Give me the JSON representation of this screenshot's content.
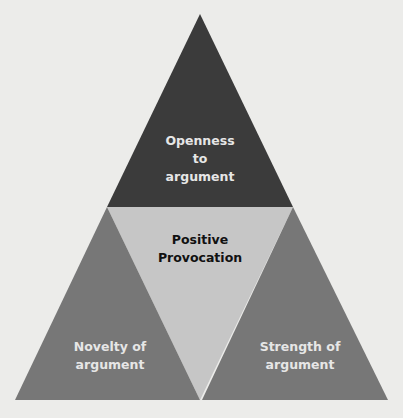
{
  "diagram": {
    "type": "triangle-of-triangles",
    "top": {
      "label_lines": [
        "Openness",
        "to",
        "argument"
      ],
      "color": "#3b3b3b"
    },
    "center": {
      "label_lines": [
        "Positive",
        "Provocation"
      ],
      "color": "#c6c6c6"
    },
    "bottom_left": {
      "label_lines": [
        "Novelty of",
        "argument"
      ],
      "color": "#777777"
    },
    "bottom_right": {
      "label_lines": [
        "Strength of",
        "argument"
      ],
      "color": "#777777"
    },
    "background": "#ececea"
  }
}
